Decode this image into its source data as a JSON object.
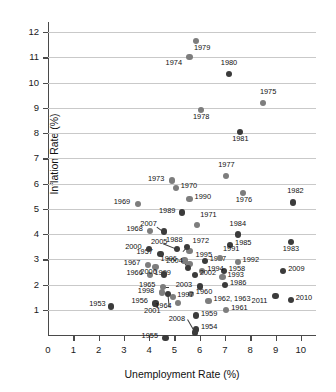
{
  "chart_data": {
    "type": "scatter",
    "title": "",
    "xlabel": "Unemployment Rate (%)",
    "ylabel": "Inflation Rate (%)",
    "xlim": [
      0,
      10.6
    ],
    "ylim": [
      0,
      12.4
    ],
    "xticks": [
      0,
      1,
      2,
      3,
      4,
      5,
      6,
      7,
      8,
      9,
      10
    ],
    "yticks": [
      1,
      2,
      3,
      4,
      5,
      6,
      7,
      8,
      9,
      10,
      11,
      12
    ],
    "grid": "horizontal",
    "legend": "none",
    "series": [
      {
        "name": "Years",
        "point_label_key": "year",
        "points": [
          {
            "year": "1953",
            "x": 2.5,
            "y": 1.13,
            "color": "#3b3b3b",
            "label_dx": -22,
            "label_dy": -3
          },
          {
            "year": "1954",
            "x": 5.85,
            "y": 0.22,
            "color": "#3b3b3b",
            "label_dx": 5,
            "label_dy": -3
          },
          {
            "year": "1955",
            "x": 4.65,
            "y": -0.13,
            "color": "#3b3b3b",
            "label_dx": -24,
            "label_dy": -3
          },
          {
            "year": "1956",
            "x": 4.25,
            "y": 1.25,
            "color": "#3b3b3b",
            "label_dx": -24,
            "label_dy": -3
          },
          {
            "year": "1957",
            "x": 4.45,
            "y": 3.22,
            "color": "#3b3b3b",
            "label_dx": -24,
            "label_dy": -3
          },
          {
            "year": "1958",
            "x": 6.95,
            "y": 2.55,
            "color": "#3b3b3b",
            "label_dx": 5,
            "label_dy": -3
          },
          {
            "year": "1959",
            "x": 5.85,
            "y": 0.77,
            "color": "#3b3b3b",
            "label_dx": 5,
            "label_dy": -3
          },
          {
            "year": "1960",
            "x": 5.65,
            "y": 1.63,
            "color": "#7d7d7d",
            "label_dx": 5,
            "label_dy": -3
          },
          {
            "year": "1961",
            "x": 7.05,
            "y": 0.98,
            "color": "#7d7d7d",
            "label_dx": 5,
            "label_dy": -3
          },
          {
            "year": "1962, 1963",
            "x": 6.35,
            "y": 1.34,
            "color": "#7d7d7d",
            "label_dx": 5,
            "label_dy": -3
          },
          {
            "year": "1964",
            "x": 5.15,
            "y": 1.28,
            "color": "#7d7d7d",
            "label_dx": -23,
            "label_dy": 2
          },
          {
            "year": "1965",
            "x": 4.55,
            "y": 1.9,
            "color": "#7d7d7d",
            "label_dx": -24,
            "label_dy": -3
          },
          {
            "year": "1966",
            "x": 4.05,
            "y": 2.37,
            "color": "#7d7d7d",
            "label_dx": -24,
            "label_dy": -3
          },
          {
            "year": "1967",
            "x": 3.95,
            "y": 2.76,
            "color": "#7d7d7d",
            "label_dx": -24,
            "label_dy": -3
          },
          {
            "year": "1968",
            "x": 4.05,
            "y": 4.13,
            "color": "#7d7d7d",
            "label_dx": -24,
            "label_dy": -3
          },
          {
            "year": "1969",
            "x": 3.55,
            "y": 5.18,
            "color": "#7d7d7d",
            "label_dx": -24,
            "label_dy": -3
          },
          {
            "year": "1970",
            "x": 5.05,
            "y": 5.82,
            "color": "#7d7d7d",
            "label_dx": 5,
            "label_dy": -3
          },
          {
            "year": "1971",
            "x": 5.9,
            "y": 4.35,
            "color": "#7d7d7d",
            "label_dx": 3,
            "label_dy": -11
          },
          {
            "year": "1972",
            "x": 5.6,
            "y": 3.33,
            "color": "#7d7d7d",
            "label_dx": 3,
            "label_dy": -11
          },
          {
            "year": "1973",
            "x": 4.9,
            "y": 6.12,
            "color": "#7d7d7d",
            "label_dx": -24,
            "label_dy": -3
          },
          {
            "year": "1974",
            "x": 5.6,
            "y": 11.0,
            "color": "#7d7d7d",
            "label_dx": -24,
            "label_dy": 5
          },
          {
            "year": "1975",
            "x": 8.5,
            "y": 9.2,
            "color": "#7d7d7d",
            "label_dx": -3,
            "label_dy": -12
          },
          {
            "year": "1976",
            "x": 7.7,
            "y": 5.62,
            "color": "#7d7d7d",
            "label_dx": -7,
            "label_dy": 6
          },
          {
            "year": "1977",
            "x": 7.05,
            "y": 6.3,
            "color": "#7d7d7d",
            "label_dx": -8,
            "label_dy": -12
          },
          {
            "year": "1978",
            "x": 6.05,
            "y": 8.9,
            "color": "#7d7d7d",
            "label_dx": -8,
            "label_dy": 6
          },
          {
            "year": "1979",
            "x": 5.85,
            "y": 11.66,
            "color": "#7d7d7d",
            "label_dx": -2,
            "label_dy": 6
          },
          {
            "year": "1980",
            "x": 7.15,
            "y": 10.35,
            "color": "#3b3b3b",
            "label_dx": -8,
            "label_dy": -12
          },
          {
            "year": "1981",
            "x": 7.6,
            "y": 8.05,
            "color": "#3b3b3b",
            "label_dx": -8,
            "label_dy": 6
          },
          {
            "year": "1982",
            "x": 9.7,
            "y": 5.25,
            "color": "#3b3b3b",
            "label_dx": -6,
            "label_dy": -12
          },
          {
            "year": "1983",
            "x": 9.6,
            "y": 3.7,
            "color": "#3b3b3b",
            "label_dx": -8,
            "label_dy": 6
          },
          {
            "year": "1984",
            "x": 7.5,
            "y": 3.98,
            "color": "#3b3b3b",
            "label_dx": -8,
            "label_dy": -12
          },
          {
            "year": "1985",
            "x": 7.2,
            "y": 3.55,
            "color": "#3b3b3b",
            "label_dx": 5,
            "label_dy": -3
          },
          {
            "year": "1986",
            "x": 7.0,
            "y": 1.98,
            "color": "#3b3b3b",
            "label_dx": 5,
            "label_dy": -3
          },
          {
            "year": "1987",
            "x": 6.2,
            "y": 2.92,
            "color": "#3b3b3b",
            "label_dx": 5,
            "label_dy": -3
          },
          {
            "year": "1988",
            "x": 5.5,
            "y": 3.48,
            "color": "#3b3b3b",
            "label_dx": -21,
            "label_dy": -8
          },
          {
            "year": "1989",
            "x": 5.3,
            "y": 4.85,
            "color": "#3b3b3b",
            "label_dx": -23,
            "label_dy": -3
          },
          {
            "year": "1990",
            "x": 5.6,
            "y": 5.4,
            "color": "#7d7d7d",
            "label_dx": 5,
            "label_dy": -3
          },
          {
            "year": "1991",
            "x": 6.8,
            "y": 3.05,
            "color": "#7d7d7d",
            "label_dx": 3,
            "label_dy": -10
          },
          {
            "year": "1992",
            "x": 7.5,
            "y": 2.9,
            "color": "#7d7d7d",
            "label_dx": 5,
            "label_dy": -3
          },
          {
            "year": "1993",
            "x": 6.9,
            "y": 2.3,
            "color": "#7d7d7d",
            "label_dx": 5,
            "label_dy": -3
          },
          {
            "year": "1994",
            "x": 6.1,
            "y": 2.55,
            "color": "#7d7d7d",
            "label_dx": 5,
            "label_dy": -3
          },
          {
            "year": "1995",
            "x": 5.6,
            "y": 2.82,
            "color": "#7d7d7d",
            "label_dx": 6,
            "label_dy": -10
          },
          {
            "year": "1996",
            "x": 5.4,
            "y": 2.95,
            "color": "#7d7d7d",
            "label_dx": -24,
            "label_dy": -3
          },
          {
            "year": "1997",
            "x": 4.95,
            "y": 1.52,
            "color": "#7d7d7d",
            "label_dx": 4,
            "label_dy": -3
          },
          {
            "year": "1998",
            "x": 4.5,
            "y": 1.68,
            "color": "#7d7d7d",
            "label_dx": -24,
            "label_dy": -3
          },
          {
            "year": "1999",
            "x": 4.25,
            "y": 2.68,
            "color": "#7d7d7d",
            "label_dx": -1,
            "label_dy": 5
          },
          {
            "year": "2000",
            "x": 4.0,
            "y": 3.42,
            "color": "#3b3b3b",
            "label_dx": -24,
            "label_dy": -3
          },
          {
            "year": "2001",
            "x": 4.75,
            "y": 1.62,
            "color": "#3b3b3b",
            "label_dx": -24,
            "label_dy": 16
          },
          {
            "year": "2002",
            "x": 5.8,
            "y": 2.37,
            "color": "#3b3b3b",
            "label_dx": 5,
            "label_dy": -3
          },
          {
            "year": "2003",
            "x": 6.0,
            "y": 1.92,
            "color": "#3b3b3b",
            "label_dx": -24,
            "label_dy": -3
          },
          {
            "year": "2004",
            "x": 5.55,
            "y": 2.65,
            "color": "#3b3b3b",
            "label_dx": -22,
            "label_dy": -8
          },
          {
            "year": "2005",
            "x": 5.1,
            "y": 3.4,
            "color": "#3b3b3b",
            "label_dx": -26,
            "label_dy": -8
          },
          {
            "year": "2006",
            "x": 4.6,
            "y": 2.4,
            "color": "#3b3b3b",
            "label_dx": -24,
            "label_dy": -3
          },
          {
            "year": "2007",
            "x": 4.6,
            "y": 4.1,
            "color": "#3b3b3b",
            "label_dx": -24,
            "label_dy": -9
          },
          {
            "year": "2008",
            "x": 5.8,
            "y": 0.1,
            "color": "#3b3b3b",
            "label_dx": -26,
            "label_dy": -14
          },
          {
            "year": "2009",
            "x": 9.3,
            "y": 2.55,
            "color": "#3b3b3b",
            "label_dx": 5,
            "label_dy": -3
          },
          {
            "year": "2010",
            "x": 9.6,
            "y": 1.38,
            "color": "#3b3b3b",
            "label_dx": 5,
            "label_dy": -3
          },
          {
            "year": "2011",
            "x": 9.0,
            "y": 1.55,
            "color": "#3b3b3b",
            "label_dx": -24,
            "label_dy": 4
          }
        ]
      }
    ],
    "leader_lines": [
      {
        "from_label": "2005",
        "x1": 5.1,
        "y1": 3.4,
        "x2": 4.55,
        "y2": 3.62
      },
      {
        "from_label": "2007",
        "x1": 4.6,
        "y1": 4.1,
        "x2": 4.3,
        "y2": 4.32
      },
      {
        "from_label": "2001",
        "x1": 4.75,
        "y1": 1.62,
        "x2": 4.8,
        "y2": 1.1
      },
      {
        "from_label": "2008",
        "x1": 5.8,
        "y1": 0.1,
        "x2": 5.5,
        "y2": 0.62
      },
      {
        "from_label": "2004",
        "x1": 5.55,
        "y1": 2.65,
        "x2": 5.4,
        "y2": 2.88
      },
      {
        "from_label": "1988",
        "x1": 5.5,
        "y1": 3.48,
        "x2": 5.35,
        "y2": 3.32
      },
      {
        "from_label": "1965",
        "x1": 4.55,
        "y1": 1.9,
        "x2": 4.8,
        "y2": 1.9
      },
      {
        "from_label": "1954",
        "x1": 5.85,
        "y1": 0.22,
        "x2": 5.72,
        "y2": 0.05
      }
    ],
    "colors": {
      "dark_point": "#3b3b3b",
      "light_point": "#7d7d7d",
      "gridline": "#c9c9c9",
      "axis": "#4a4a4a",
      "background": "#ffffff"
    }
  }
}
